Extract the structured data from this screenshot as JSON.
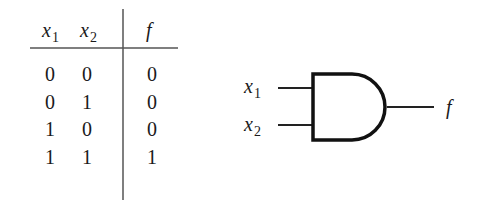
{
  "truth_table": {
    "headers": [
      {
        "name": "x",
        "sub": "1"
      },
      {
        "name": "x",
        "sub": "2"
      },
      {
        "name": "f",
        "sub": ""
      }
    ],
    "rows": [
      [
        "0",
        "0",
        "0"
      ],
      [
        "0",
        "1",
        "0"
      ],
      [
        "1",
        "0",
        "0"
      ],
      [
        "1",
        "1",
        "1"
      ]
    ]
  },
  "gate": {
    "type": "AND",
    "inputs": [
      {
        "name": "x",
        "sub": "1"
      },
      {
        "name": "x",
        "sub": "2"
      }
    ],
    "output": {
      "name": "f"
    }
  }
}
